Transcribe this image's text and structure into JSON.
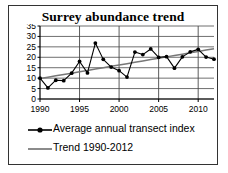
{
  "figure": {
    "title": "Surrey abundance trend",
    "border_color": "#333333",
    "background": "#ffffff"
  },
  "legend": {
    "position": "below-plot",
    "entries": [
      {
        "label": "Average annual transect index",
        "marker": "line-with-dot",
        "color": "#000000"
      },
      {
        "label": "Trend 1990-2012",
        "marker": "line",
        "color": "#777777"
      }
    ]
  },
  "chart_data": {
    "type": "line",
    "title": "Surrey abundance trend",
    "xlabel": "",
    "ylabel": "",
    "xlim": [
      1990,
      2012
    ],
    "ylim": [
      0,
      35
    ],
    "yticks": [
      0,
      5,
      10,
      15,
      20,
      25,
      30,
      35
    ],
    "xticks": [
      1990,
      1995,
      2000,
      2005,
      2010
    ],
    "xtick_labels": [
      "1990",
      "1995",
      "2000",
      "2005",
      "2010"
    ],
    "ytick_labels": [
      "0",
      "5",
      "10",
      "15",
      "20",
      "25",
      "30",
      "35"
    ],
    "grid": "horizontal-and-major-vertical",
    "x": [
      1990,
      1991,
      1992,
      1993,
      1994,
      1995,
      1996,
      1997,
      1998,
      1999,
      2000,
      2001,
      2002,
      2003,
      2004,
      2005,
      2006,
      2007,
      2008,
      2009,
      2010,
      2011,
      2012
    ],
    "series": [
      {
        "name": "Average annual transect index",
        "marker": "circle",
        "color": "#000000",
        "values": [
          10.0,
          5.3,
          9.0,
          8.8,
          12.4,
          18.0,
          12.5,
          26.8,
          19.0,
          15.3,
          13.6,
          10.5,
          22.5,
          21.3,
          24.0,
          20.0,
          20.3,
          14.8,
          20.2,
          22.6,
          23.8,
          20.1,
          19.1
        ]
      },
      {
        "name": "Trend 1990-2012",
        "marker": "none",
        "color": "#777777",
        "values": [
          9.8,
          10.45,
          11.1,
          11.75,
          12.4,
          13.05,
          13.7,
          14.35,
          15.0,
          15.65,
          16.3,
          16.95,
          17.6,
          18.25,
          18.9,
          19.55,
          20.2,
          20.85,
          21.5,
          22.15,
          22.8,
          23.45,
          24.1
        ]
      }
    ]
  }
}
